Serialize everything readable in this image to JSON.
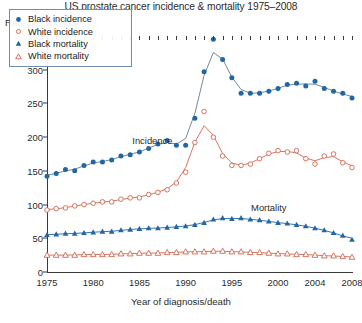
{
  "chart_data": {
    "type": "line",
    "title": "US prostate cancer incidence & mortality 1975–2008",
    "ylabel": "Rate per 100,000",
    "xlabel": "Year of diagnosis/death",
    "ylim": [
      0,
      350
    ],
    "yticks": [
      0,
      50,
      100,
      150,
      200,
      250,
      300,
      350
    ],
    "xlim": [
      1975,
      2008
    ],
    "xticks": [
      1975,
      1980,
      1985,
      1990,
      1995,
      2000,
      2004,
      2008
    ],
    "grid": false,
    "legend_position": "upper-left",
    "annotations": [
      {
        "text": "Incidence",
        "x": 1986.4,
        "y": 196
      },
      {
        "text": "Mortality",
        "x": 1999.0,
        "y": 97
      }
    ],
    "x": [
      1975,
      1976,
      1977,
      1978,
      1979,
      1980,
      1981,
      1982,
      1983,
      1984,
      1985,
      1986,
      1987,
      1988,
      1989,
      1990,
      1991,
      1992,
      1993,
      1994,
      1995,
      1996,
      1997,
      1998,
      1999,
      2000,
      2001,
      2002,
      2003,
      2004,
      2005,
      2006,
      2007,
      2008
    ],
    "series": [
      {
        "name": "Black incidence",
        "marker": "filled-circle",
        "color": "#2166a5",
        "values": [
          142,
          146,
          152,
          150,
          158,
          163,
          163,
          166,
          172,
          174,
          178,
          183,
          190,
          195,
          188,
          188,
          228,
          297,
          345,
          315,
          288,
          265,
          265,
          265,
          268,
          272,
          278,
          280,
          276,
          283,
          272,
          268,
          265,
          258
        ]
      },
      {
        "name": "White incidence",
        "marker": "open-circle",
        "color": "#d4654f",
        "values": [
          92,
          94,
          95,
          98,
          100,
          102,
          104,
          104,
          108,
          110,
          110,
          115,
          118,
          122,
          132,
          148,
          192,
          238,
          200,
          172,
          158,
          158,
          160,
          168,
          176,
          180,
          178,
          180,
          168,
          160,
          172,
          175,
          162,
          155
        ]
      },
      {
        "name": "Black mortality",
        "marker": "filled-triangle",
        "color": "#2166a5",
        "values": [
          55,
          56,
          57,
          57,
          58,
          59,
          60,
          60,
          62,
          63,
          64,
          65,
          65,
          66,
          67,
          68,
          70,
          73,
          78,
          80,
          79,
          80,
          78,
          77,
          75,
          73,
          72,
          70,
          68,
          65,
          62,
          58,
          54,
          48
        ]
      },
      {
        "name": "White mortality",
        "marker": "open-triangle",
        "color": "#d4654f",
        "values": [
          25,
          25,
          25,
          25,
          26,
          26,
          26,
          26,
          27,
          27,
          28,
          28,
          28,
          29,
          29,
          30,
          30,
          30,
          31,
          31,
          30,
          30,
          29,
          29,
          28,
          27,
          27,
          26,
          26,
          25,
          24,
          24,
          23,
          22
        ]
      }
    ]
  },
  "legend": {
    "items": [
      {
        "label": "Black incidence",
        "marker": "filled-circle",
        "color": "#2166a5"
      },
      {
        "label": "White incidence",
        "marker": "open-circle",
        "color": "#d4654f"
      },
      {
        "label": "Black mortality",
        "marker": "filled-triangle",
        "color": "#2166a5"
      },
      {
        "label": "White mortality",
        "marker": "open-triangle",
        "color": "#d4654f"
      }
    ]
  },
  "caption": ""
}
